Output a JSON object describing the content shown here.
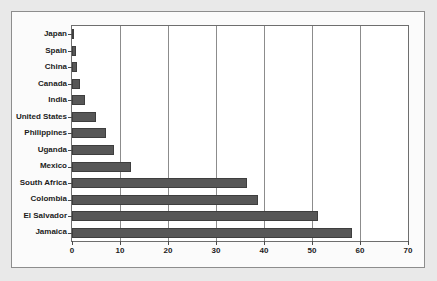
{
  "chart_data": {
    "type": "bar",
    "orientation": "horizontal",
    "title": "",
    "xlabel": "",
    "ylabel": "",
    "xlim": [
      0,
      70
    ],
    "xticks": [
      0,
      10,
      20,
      30,
      40,
      50,
      60,
      70
    ],
    "grid": true,
    "legend": false,
    "bar_color": "#575757",
    "categories": [
      "Japan",
      "Spain",
      "China",
      "Canada",
      "India",
      "United States",
      "Philippines",
      "Uganda",
      "Mexico",
      "South Africa",
      "Colombia",
      "El Salvador",
      "Jamaica"
    ],
    "values": [
      0.4,
      0.8,
      1.1,
      1.6,
      2.8,
      5.0,
      7.0,
      8.8,
      12.2,
      36.5,
      38.8,
      51.2,
      58.4
    ]
  }
}
